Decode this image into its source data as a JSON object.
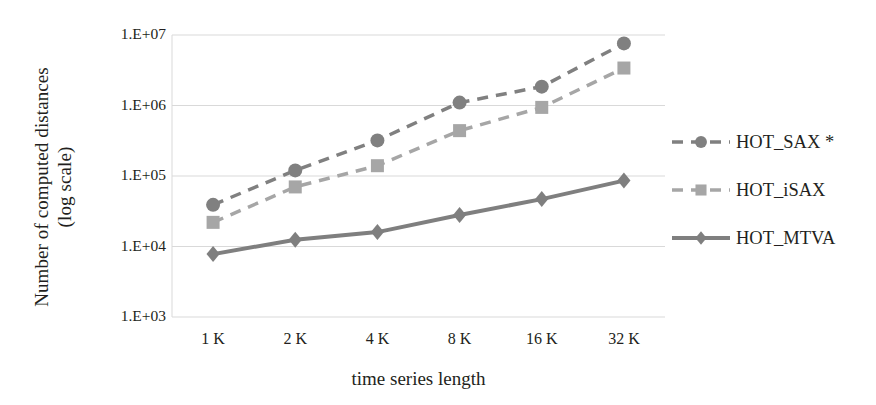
{
  "chart_data": {
    "type": "line",
    "title": "",
    "xlabel": "time series length",
    "ylabel": "Number of computed distances (log scale)",
    "ylabel_line1": "Number of computed distances",
    "ylabel_line2": "(log scale)",
    "categories": [
      "1 K",
      "2 K",
      "4 K",
      "8 K",
      "16 K",
      "32 K"
    ],
    "x": [
      1024,
      2048,
      4096,
      8192,
      16384,
      32768
    ],
    "yticks": [
      "1.E+03",
      "1.E+04",
      "1.E+05",
      "1.E+06",
      "1.E+07"
    ],
    "ytick_values": [
      1000,
      10000,
      100000,
      1000000,
      10000000
    ],
    "yscale": "log",
    "ylim": [
      1000,
      10000000
    ],
    "grid": true,
    "legend_position": "right",
    "series": [
      {
        "name": "HOT_SAX *",
        "marker": "circle",
        "linestyle": "dashed",
        "color": "#808080",
        "values": [
          39000,
          120000,
          320000,
          1100000,
          1850000,
          7600000
        ]
      },
      {
        "name": "HOT_iSAX",
        "marker": "square",
        "linestyle": "dashed",
        "color": "#a6a6a6",
        "values": [
          22000,
          70000,
          140000,
          440000,
          940000,
          3400000
        ]
      },
      {
        "name": "HOT_MTVA",
        "marker": "diamond",
        "linestyle": "solid",
        "color": "#7f7f7f",
        "values": [
          7800,
          12500,
          16000,
          28000,
          47000,
          86000
        ]
      }
    ]
  },
  "legend": {
    "items": [
      {
        "label": "HOT_SAX *"
      },
      {
        "label": "HOT_iSAX"
      },
      {
        "label": "HOT_MTVA"
      }
    ]
  },
  "colors": {
    "grid": "#d9d9d9",
    "text": "#231f20",
    "series_dark": "#808080",
    "series_light": "#a6a6a6",
    "series_solid": "#7f7f7f",
    "background": "#ffffff"
  }
}
